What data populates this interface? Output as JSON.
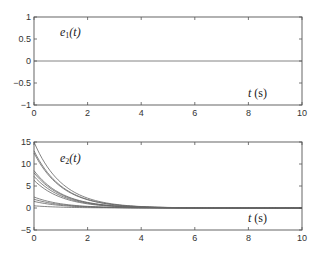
{
  "chart_data": [
    {
      "type": "line",
      "title": "",
      "annotation": "e1(t)",
      "xlabel": "t (s)",
      "ylabel": "",
      "xlim": [
        0,
        10
      ],
      "ylim": [
        -1,
        1
      ],
      "xticks": [
        0,
        2,
        4,
        6,
        8,
        10
      ],
      "yticks": [
        -1,
        -0.5,
        0,
        0.5,
        1
      ],
      "ytick_labels": [
        "−1",
        "−0.5",
        "0",
        "0.5",
        "1"
      ],
      "grid": false,
      "series": [
        {
          "name": "e1",
          "x": [
            0,
            10
          ],
          "values": [
            0,
            0
          ]
        }
      ]
    },
    {
      "type": "line",
      "title": "",
      "annotation": "e2(t)",
      "xlabel": "t (s)",
      "ylabel": "",
      "xlim": [
        0,
        10
      ],
      "ylim": [
        -5,
        15
      ],
      "xticks": [
        0,
        2,
        4,
        6,
        8,
        10
      ],
      "yticks": [
        -5,
        0,
        5,
        10,
        15
      ],
      "ytick_labels": [
        "−5",
        "0",
        "5",
        "10",
        "15"
      ],
      "grid": false,
      "description": "Family of exponentially decaying trajectories converging to 0 by about t=5 s",
      "series": [
        {
          "name": "traj1",
          "initial": 15.0
        },
        {
          "name": "traj2",
          "initial": 13.0
        },
        {
          "name": "traj3",
          "initial": 12.5
        },
        {
          "name": "traj4",
          "initial": 8.5
        },
        {
          "name": "traj5",
          "initial": 8.0
        },
        {
          "name": "traj6",
          "initial": 7.2
        },
        {
          "name": "traj7",
          "initial": 6.3
        },
        {
          "name": "traj8",
          "initial": 2.5
        },
        {
          "name": "traj9",
          "initial": 2.0
        },
        {
          "name": "traj10",
          "initial": 1.5
        },
        {
          "name": "traj11",
          "initial": 0.5
        }
      ],
      "decay_rate": 0.95
    }
  ],
  "labels": {
    "e1_sym": "e",
    "e1_sub": "1",
    "e2_sym": "e",
    "e2_sub": "2",
    "targ": "(t)",
    "t": "t",
    "s": "(s)"
  }
}
